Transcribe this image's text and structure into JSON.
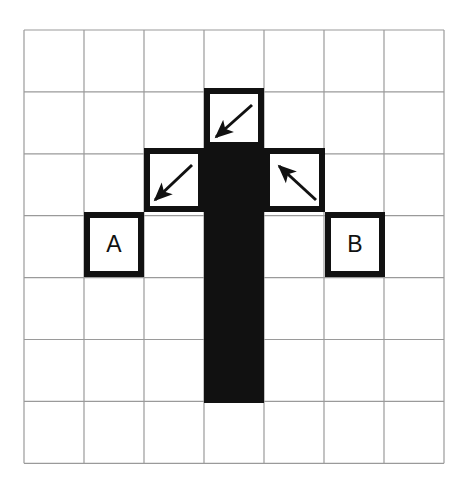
{
  "figure": {
    "background_color": "#ffffff",
    "grid": {
      "columns": 7,
      "rows": 7,
      "origin_x": 24,
      "origin_y": 30,
      "cell_width": 60,
      "cell_height": 61.9,
      "line_color": "#9a9a9a",
      "line_width": 1.2
    },
    "shape": {
      "name": "black-shape",
      "fill_color": "#111111",
      "description": "vertical black bar one cell wide spanning rows 2-5 in column 3, with a black cell filling row 2 of column 3 joined to the stem",
      "segments": [
        {
          "name": "vertical-stem",
          "col": 3,
          "row_start": 2,
          "row_end": 6,
          "x": 204,
          "y": 147,
          "width": 60,
          "height": 256
        }
      ]
    },
    "outlined_squares": [
      {
        "name": "top-arrow-square",
        "col": 3,
        "row": 1,
        "x": 204,
        "y": 88,
        "width": 60,
        "height": 60,
        "stroke_color": "#111111",
        "stroke_width": 6,
        "fill": "#ffffff",
        "label": ""
      },
      {
        "name": "left-arrow-square",
        "col": 2,
        "row": 2,
        "x": 144,
        "y": 148,
        "width": 60,
        "height": 64,
        "stroke_color": "#111111",
        "stroke_width": 6,
        "fill": "#ffffff",
        "label": ""
      },
      {
        "name": "right-arrow-square",
        "col": 4,
        "row": 2,
        "x": 264,
        "y": 148,
        "width": 61,
        "height": 64,
        "stroke_color": "#111111",
        "stroke_width": 6,
        "fill": "#ffffff",
        "label": ""
      },
      {
        "name": "square-a",
        "col": 1,
        "row": 3,
        "x": 84,
        "y": 212,
        "width": 60,
        "height": 65,
        "stroke_color": "#111111",
        "stroke_width": 6,
        "fill": "#ffffff",
        "label": "A"
      },
      {
        "name": "square-b",
        "col": 5,
        "row": 3,
        "x": 325,
        "y": 212,
        "width": 60,
        "height": 65,
        "stroke_color": "#111111",
        "stroke_width": 6,
        "fill": "#ffffff",
        "label": "B"
      }
    ],
    "arrows": [
      {
        "name": "arrow-top-southwest",
        "direction": "southwest",
        "color": "#111111",
        "x1": 252,
        "y1": 105,
        "x2": 216,
        "y2": 137
      },
      {
        "name": "arrow-middle-left-southwest",
        "direction": "southwest",
        "color": "#111111",
        "x1": 192,
        "y1": 165,
        "x2": 155,
        "y2": 200
      },
      {
        "name": "arrow-middle-right-northwest",
        "direction": "northwest",
        "color": "#111111",
        "x1": 316,
        "y1": 200,
        "x2": 279,
        "y2": 166
      }
    ],
    "labels": {
      "a": "A",
      "b": "B"
    }
  }
}
